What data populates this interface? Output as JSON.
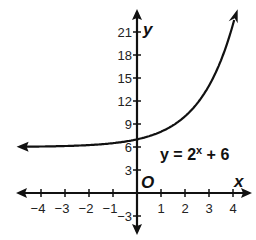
{
  "chart_data": {
    "type": "line",
    "title": "",
    "equation": {
      "lhs": "y = 2",
      "exp": "x",
      "rhs": " + 6"
    },
    "xlabel": "x",
    "ylabel": "y",
    "origin_label": "O",
    "xlim": [
      -4.5,
      4.5
    ],
    "ylim": [
      -4,
      24
    ],
    "x_ticks": [
      -4,
      -3,
      -2,
      -1,
      1,
      2,
      3,
      4
    ],
    "x_tick_labels": [
      "−4",
      "−3",
      "−2",
      "−1",
      "1",
      "2",
      "3",
      "4"
    ],
    "y_ticks": [
      -3,
      3,
      6,
      9,
      12,
      15,
      18,
      21
    ],
    "y_tick_labels": [
      "−3",
      "3",
      "6",
      "9",
      "12",
      "15",
      "18",
      "21"
    ],
    "grid": false,
    "series": [
      {
        "name": "y = 2^x + 6",
        "function": "2^x + 6",
        "asymptote": 6,
        "x": [
          -4,
          -3,
          -2,
          -1,
          0,
          1,
          2,
          3,
          4
        ],
        "values": [
          6.0625,
          6.125,
          6.25,
          6.5,
          7,
          8,
          10,
          14,
          22
        ]
      }
    ]
  }
}
